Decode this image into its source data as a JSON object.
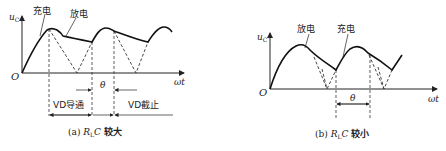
{
  "diagrams": [
    {
      "id": "a",
      "y_axis_label": "u",
      "y_axis_subscript": "C",
      "x_axis_label": "ωt",
      "origin_label": "O",
      "annotations": {
        "charge": "充电",
        "discharge": "放电",
        "theta": "θ",
        "conduct": "VD导通",
        "cutoff": "VD截止"
      },
      "caption": {
        "prefix": "(a)",
        "var": "R",
        "sub": "L",
        "var2": "C",
        "suffix": "较大"
      }
    },
    {
      "id": "b",
      "y_axis_label": "u",
      "y_axis_subscript": "C",
      "x_axis_label": "ωt",
      "origin_label": "O",
      "annotations": {
        "discharge": "放电",
        "charge": "充电",
        "theta": "θ"
      },
      "caption": {
        "prefix": "(b)",
        "var": "R",
        "sub": "L",
        "var2": "C",
        "suffix": "较小"
      }
    }
  ]
}
